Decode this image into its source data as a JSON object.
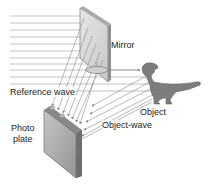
{
  "diagram": {
    "labels": {
      "mirror": "Mirror",
      "reference_wave": "Reference wave",
      "object": "Object",
      "object_wave": "Object-wave",
      "photo_plate_line1": "Photo",
      "photo_plate_line2": "plate"
    },
    "elements": [
      {
        "name": "incoming-laser-beams",
        "count": 11
      },
      {
        "name": "mirror"
      },
      {
        "name": "beam-splitter"
      },
      {
        "name": "dinosaur-object"
      },
      {
        "name": "photo-plate"
      }
    ],
    "colors": {
      "beam": "#8a8a8a",
      "mirror_frame": "#9a9a9a",
      "mirror_face": "#d8d8d8",
      "plate_face": "#a9a9a9",
      "plate_edge": "#7a7a7a",
      "dino": "#7d7d7d"
    }
  }
}
